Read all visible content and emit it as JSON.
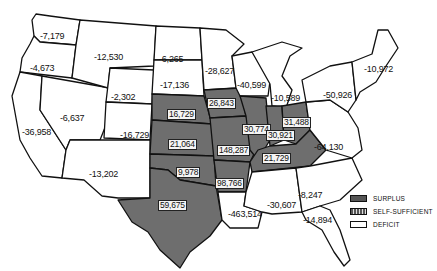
{
  "map": {
    "type": "choropleth",
    "subject": "State balance by region (surplus / deficit)",
    "colors": {
      "surplus": "#6e6e6e",
      "self_sufficient": "#9a9a9a",
      "deficit": "#ffffff",
      "border": "#111111"
    }
  },
  "labels": [
    {
      "id": "washington",
      "value": "-7,179",
      "x": 40,
      "y": 31,
      "boxed": false
    },
    {
      "id": "oregon",
      "value": "-4,673",
      "x": 30,
      "y": 63,
      "boxed": false
    },
    {
      "id": "california",
      "value": "-36,958",
      "x": 22,
      "y": 127,
      "boxed": false
    },
    {
      "id": "idaho-montana",
      "value": "-12,530",
      "x": 94,
      "y": 52,
      "boxed": false
    },
    {
      "id": "nevada-utah",
      "value": "-6,637",
      "x": 60,
      "y": 113,
      "boxed": false
    },
    {
      "id": "wyoming",
      "value": "-2,302",
      "x": 111,
      "y": 92,
      "boxed": false
    },
    {
      "id": "colorado",
      "value": "-16,729",
      "x": 120,
      "y": 130,
      "boxed": false
    },
    {
      "id": "arizona-new-mexico",
      "value": "-13,202",
      "x": 89,
      "y": 169,
      "boxed": false
    },
    {
      "id": "north-dakota",
      "value": "-6,265",
      "x": 159,
      "y": 54,
      "boxed": false
    },
    {
      "id": "south-dakota",
      "value": "-17,136",
      "x": 160,
      "y": 80,
      "boxed": false
    },
    {
      "id": "nebraska",
      "value": "16,729",
      "x": 167,
      "y": 109,
      "boxed": true
    },
    {
      "id": "kansas",
      "value": "21,064",
      "x": 168,
      "y": 139,
      "boxed": true
    },
    {
      "id": "oklahoma",
      "value": "9,978",
      "x": 176,
      "y": 167,
      "boxed": true
    },
    {
      "id": "texas",
      "value": "59,675",
      "x": 158,
      "y": 200,
      "boxed": true
    },
    {
      "id": "minnesota",
      "value": "-28,627",
      "x": 205,
      "y": 66,
      "boxed": false
    },
    {
      "id": "iowa",
      "value": "26,843",
      "x": 207,
      "y": 98,
      "boxed": true
    },
    {
      "id": "missouri",
      "value": "148,287",
      "x": 217,
      "y": 145,
      "boxed": true
    },
    {
      "id": "arkansas",
      "value": "98,766",
      "x": 215,
      "y": 178,
      "boxed": true
    },
    {
      "id": "louisiana",
      "value": "-463,514",
      "x": 228,
      "y": 209,
      "boxed": false
    },
    {
      "id": "wisconsin",
      "value": "-40,599",
      "x": 237,
      "y": 80,
      "boxed": false
    },
    {
      "id": "illinois",
      "value": "30,774",
      "x": 242,
      "y": 124,
      "boxed": true
    },
    {
      "id": "michigan",
      "value": "-10,589",
      "x": 271,
      "y": 93,
      "boxed": false
    },
    {
      "id": "indiana",
      "value": "30,921",
      "x": 266,
      "y": 130,
      "boxed": true
    },
    {
      "id": "ohio",
      "value": "31,488",
      "x": 282,
      "y": 117,
      "boxed": true
    },
    {
      "id": "kentucky-tennessee",
      "value": "21,729",
      "x": 262,
      "y": 153,
      "boxed": true
    },
    {
      "id": "mississippi-alabama",
      "value": "-30,607",
      "x": 267,
      "y": 200,
      "boxed": false
    },
    {
      "id": "georgia-carolinas",
      "value": "-8,247",
      "x": 298,
      "y": 190,
      "boxed": false
    },
    {
      "id": "florida",
      "value": "-14,894",
      "x": 303,
      "y": 215,
      "boxed": false
    },
    {
      "id": "virginia-east",
      "value": "-64,130",
      "x": 314,
      "y": 142,
      "boxed": false
    },
    {
      "id": "new-york-mid-atlantic",
      "value": "-50,926",
      "x": 323,
      "y": 90,
      "boxed": false
    },
    {
      "id": "new-england",
      "value": "-10,972",
      "x": 364,
      "y": 64,
      "boxed": false
    }
  ],
  "legend": {
    "items": [
      {
        "key": "surplus",
        "label": "SURPLUS"
      },
      {
        "key": "self",
        "label": "SELF-SUFFICIENT"
      },
      {
        "key": "deficit",
        "label": "DEFICIT"
      }
    ]
  }
}
